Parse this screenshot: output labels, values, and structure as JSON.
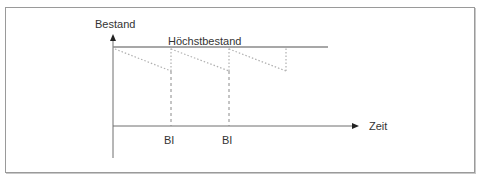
{
  "diagram": {
    "type": "inventory-sawtooth",
    "y_axis_label": "Bestand",
    "x_axis_label": "Zeit",
    "max_level_label": "Höchstbestand",
    "order_points": [
      {
        "label": "BI"
      },
      {
        "label": "BI"
      }
    ],
    "colors": {
      "axis": "#6e6e6e",
      "max_line": "#8a8a8a",
      "dotted": "#b0b0b0",
      "dashed": "#8a8a8a",
      "text": "#333333",
      "frame": "#9a9a9a"
    }
  }
}
